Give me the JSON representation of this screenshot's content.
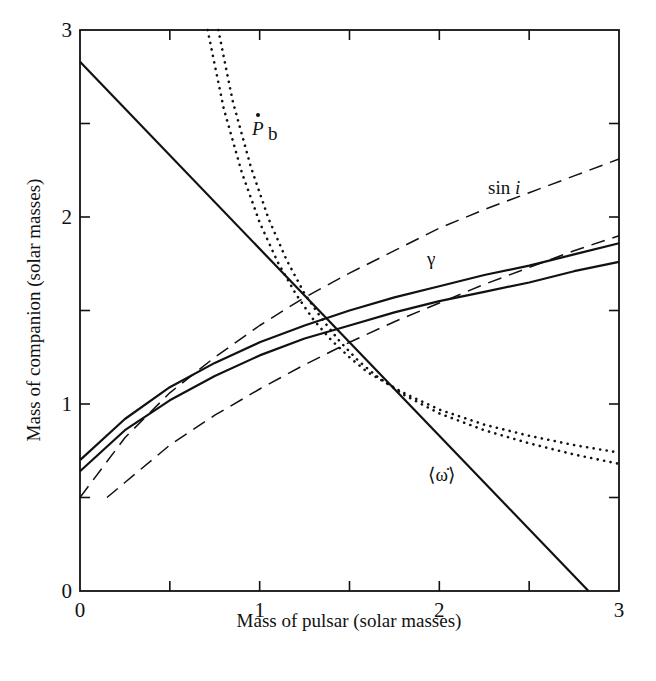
{
  "chart_data": {
    "type": "line",
    "title": "",
    "xlabel": "Mass of pulsar (solar masses)",
    "ylabel": "Mass of companion (solar masses)",
    "xlim": [
      0,
      3
    ],
    "ylim": [
      0,
      3
    ],
    "grid": false,
    "legend": "none (curves labeled inline)",
    "x_ticks": [
      0,
      0.5,
      1,
      1.5,
      2,
      2.5,
      3
    ],
    "x_tick_labels": [
      "0",
      "",
      "1",
      "",
      "2",
      "",
      "3"
    ],
    "y_ticks": [
      0,
      0.5,
      1,
      1.5,
      2,
      2.5,
      3
    ],
    "y_tick_labels": [
      "0",
      "",
      "1",
      "",
      "2",
      "",
      "3"
    ],
    "series": [
      {
        "name": "omega-dot (periastron advance)",
        "label": "⟨ω̇⟩",
        "style": "solid",
        "x": [
          0,
          2.83
        ],
        "y": [
          2.83,
          0
        ]
      },
      {
        "name": "gamma upper",
        "label": "γ",
        "style": "solid",
        "x": [
          0,
          0.25,
          0.5,
          0.75,
          1.0,
          1.25,
          1.5,
          1.75,
          2.0,
          2.25,
          2.5,
          2.75,
          3.0
        ],
        "y": [
          0.7,
          0.92,
          1.09,
          1.22,
          1.33,
          1.42,
          1.5,
          1.57,
          1.63,
          1.69,
          1.74,
          1.8,
          1.86
        ]
      },
      {
        "name": "gamma lower",
        "label": "",
        "style": "solid",
        "x": [
          0,
          0.25,
          0.5,
          0.75,
          1.0,
          1.25,
          1.5,
          1.75,
          2.0,
          2.25,
          2.5,
          2.75,
          3.0
        ],
        "y": [
          0.64,
          0.86,
          1.02,
          1.15,
          1.26,
          1.35,
          1.42,
          1.49,
          1.55,
          1.6,
          1.65,
          1.71,
          1.76
        ]
      },
      {
        "name": "sin i upper",
        "label": "sin i",
        "style": "dashed",
        "x": [
          0,
          0.25,
          0.5,
          0.75,
          1.0,
          1.25,
          1.5,
          1.75,
          2.0,
          2.25,
          2.5,
          2.75,
          3.0
        ],
        "y": [
          0.5,
          0.82,
          1.06,
          1.25,
          1.42,
          1.57,
          1.7,
          1.82,
          1.94,
          2.04,
          2.13,
          2.22,
          2.31
        ]
      },
      {
        "name": "sin i lower",
        "label": "",
        "style": "dashed",
        "x": [
          0.15,
          0.25,
          0.5,
          0.75,
          1.0,
          1.25,
          1.5,
          1.75,
          2.0,
          2.25,
          2.5,
          2.75,
          3.0
        ],
        "y": [
          0.5,
          0.58,
          0.78,
          0.94,
          1.08,
          1.21,
          1.33,
          1.44,
          1.54,
          1.64,
          1.73,
          1.82,
          1.9
        ]
      },
      {
        "name": "P_b-dot upper",
        "label": "Ṗb",
        "style": "dotted",
        "x": [
          0.71,
          0.8,
          0.9,
          1.0,
          1.1,
          1.2,
          1.3,
          1.4,
          1.5,
          1.6,
          1.8,
          2.0,
          2.25,
          2.5,
          2.75,
          3.0
        ],
        "y": [
          3.0,
          2.58,
          2.24,
          1.97,
          1.76,
          1.59,
          1.45,
          1.34,
          1.25,
          1.17,
          1.06,
          0.97,
          0.89,
          0.83,
          0.78,
          0.74
        ]
      },
      {
        "name": "P_b-dot lower",
        "label": "",
        "style": "dotted",
        "x": [
          0.77,
          0.85,
          0.95,
          1.05,
          1.15,
          1.25,
          1.35,
          1.45,
          1.55,
          1.65,
          1.8,
          2.0,
          2.25,
          2.5,
          2.75,
          3.0
        ],
        "y": [
          3.0,
          2.62,
          2.27,
          1.99,
          1.77,
          1.59,
          1.45,
          1.33,
          1.23,
          1.15,
          1.05,
          0.95,
          0.86,
          0.79,
          0.73,
          0.68
        ]
      }
    ],
    "annotations": [
      {
        "text": "Ṗb",
        "x": 0.58,
        "y": 2.53
      },
      {
        "text": "sin i",
        "x": 2.08,
        "y": 2.17
      },
      {
        "text": "γ",
        "x": 1.93,
        "y": 1.76
      },
      {
        "text": "⟨ω̇⟩",
        "x": 1.93,
        "y": 0.62
      }
    ]
  },
  "labels": {
    "xlabel": "Mass of pulsar (solar masses)",
    "ylabel": "Mass of companion (solar masses)",
    "pb": "P",
    "pb_sub": "b",
    "sini": "sin ",
    "sini_i": "i",
    "gamma": "γ",
    "omega": "⟨ω̇⟩"
  }
}
